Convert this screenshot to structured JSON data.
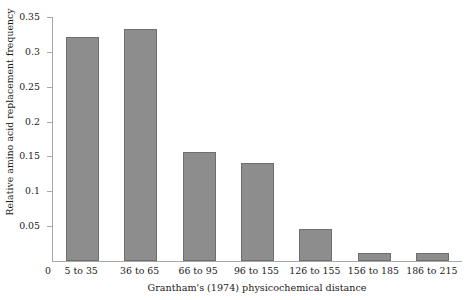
{
  "chart_data": {
    "type": "bar",
    "title": "",
    "xlabel": "Grantham's (1974) physicochemical distance",
    "ylabel": "Relative amino acid replacement frequency",
    "categories": [
      "5 to 35",
      "36 to 65",
      "66 to 95",
      "96 to 155",
      "126 to 155",
      "156 to 185",
      "186 to 215"
    ],
    "values": [
      0.322,
      0.333,
      0.157,
      0.141,
      0.046,
      0.012,
      0.012
    ],
    "ylim": [
      0,
      0.35
    ],
    "ytick_values": [
      0,
      0.05,
      0.1,
      0.15,
      0.2,
      0.25,
      0.3,
      0.35
    ],
    "ytick_labels": [
      "0",
      "0.05",
      "0.1",
      "0.15",
      "0.2",
      "0.25",
      "0.3",
      "0.35"
    ],
    "origin_label": "0",
    "grid": false,
    "legend": "none",
    "bar_color": "#8d8d8d",
    "bar_edge_color": "#6f6f6f",
    "axis_color": "#a8a8a8",
    "background_color": "#ffffff"
  }
}
